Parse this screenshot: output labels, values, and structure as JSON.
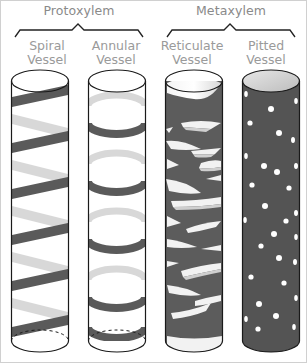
{
  "groups": [
    {
      "title": "Protoxylem",
      "vessels": [
        "Spiral Vessel",
        "Annular Vessel"
      ]
    },
    {
      "title": "Metaxylem",
      "vessels": [
        "Reticulate Vessel",
        "Pitted Vessel"
      ]
    }
  ],
  "vessels": [
    {
      "id": "spiral",
      "line1": "Spiral",
      "line2": "Vessel",
      "thickening": "spiral bands"
    },
    {
      "id": "annular",
      "line1": "Annular",
      "line2": "Vessel",
      "thickening": "ring bands"
    },
    {
      "id": "reticulate",
      "line1": "Reticulate",
      "line2": "Vessel",
      "thickening": "net-like wall"
    },
    {
      "id": "pitted",
      "line1": "Pitted",
      "line2": "Vessel",
      "thickening": "walls with pits"
    }
  ],
  "colors": {
    "band_dark": "#5a5a5a",
    "band_back": "#d6d6d6",
    "outline": "#1a1a1a",
    "label_text": "#9a9a9a",
    "frame_border": "#d0d0d0"
  }
}
